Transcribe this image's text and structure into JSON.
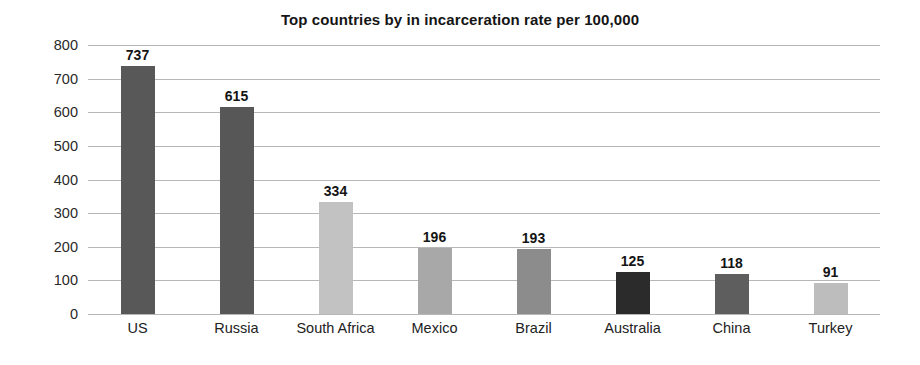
{
  "chart_data": {
    "type": "bar",
    "title": "Top countries by in incarceration rate per 100,000",
    "xlabel": "",
    "ylabel": "",
    "ylim": [
      0,
      800
    ],
    "ytick_step": 100,
    "yticks": [
      "800",
      "700",
      "600",
      "500",
      "400",
      "300",
      "200",
      "100",
      "0"
    ],
    "grid": "horizontal",
    "legend": "none",
    "categories": [
      "US",
      "Russia",
      "South Africa",
      "Mexico",
      "Brazil",
      "Australia",
      "China",
      "Turkey"
    ],
    "values": [
      737,
      615,
      334,
      196,
      193,
      125,
      118,
      91
    ],
    "value_labels": [
      "737",
      "615",
      "334",
      "196",
      "193",
      "125",
      "118",
      "91"
    ],
    "bar_colors": [
      "#585858",
      "#575757",
      "#c2c2c2",
      "#a8a8a8",
      "#8c8c8c",
      "#2b2b2b",
      "#5e5e5e",
      "#bdbdbd"
    ],
    "gridline_color": "#b7b7b7",
    "background_color": "#ffffff"
  }
}
